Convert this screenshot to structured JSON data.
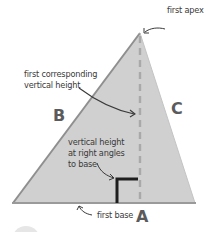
{
  "diagram": {
    "title": "",
    "colors": {
      "triangle_fill": "#d0d0d0",
      "triangle_edge": "#9a9a9a",
      "dashed_height": "#a9a9a9",
      "right_angle_mark": "#1e1e1e",
      "text": "#3a3a3a",
      "vertex_label": "#5b5b5b",
      "decor_circle": "#e6e6e6"
    },
    "vertices": {
      "A": {
        "label": "A",
        "role": "base side"
      },
      "B": {
        "label": "B",
        "role": "left side"
      },
      "C": {
        "label": "C",
        "role": "right side"
      }
    },
    "annotations": {
      "apex": {
        "text": "first apex"
      },
      "corresponding_height": {
        "line1": "first corresponding",
        "line2": "vertical height"
      },
      "right_angle": {
        "line1": "vertical height",
        "line2": "at right angles",
        "line3": "to base"
      },
      "base": {
        "text": "first base"
      }
    }
  }
}
